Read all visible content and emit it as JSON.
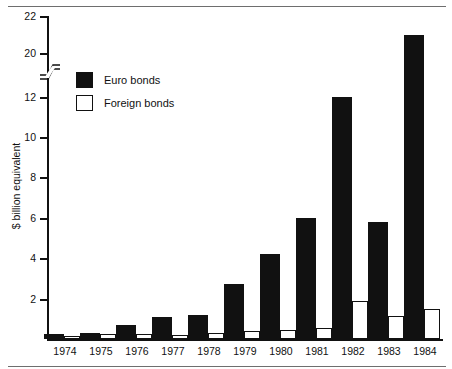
{
  "chart_data": {
    "type": "bar",
    "title": "",
    "subtitle": "",
    "xlabel": "",
    "ylabel": "$ billion equivalent",
    "categories": [
      "1974",
      "1975",
      "1976",
      "1977",
      "1978",
      "1979",
      "1980",
      "1981",
      "1982",
      "1983",
      "1984"
    ],
    "series": [
      {
        "name": "Euro bonds",
        "color": "#111111",
        "style": "filled",
        "values": [
          0.25,
          0.3,
          0.7,
          1.1,
          1.2,
          2.75,
          4.2,
          6.0,
          12.0,
          5.8,
          21.0
        ]
      },
      {
        "name": "Foreign bonds",
        "color": "#ffffff",
        "style": "hollow-outlined",
        "values": [
          0.15,
          0.25,
          0.25,
          0.2,
          0.3,
          0.4,
          0.45,
          0.55,
          1.9,
          1.15,
          1.5
        ]
      }
    ],
    "ylim": [
      0,
      22
    ],
    "y_axis_broken": true,
    "y_axis_break_between": [
      12,
      20
    ],
    "ytick_labels": [
      "2",
      "4",
      "6",
      "8",
      "10",
      "12",
      "20",
      "22"
    ],
    "ytick_values": [
      2,
      4,
      6,
      8,
      10,
      12,
      20,
      22
    ],
    "grid": false,
    "legend_position": "upper-left-inside"
  },
  "axis": {
    "y_title": "$ billion equivalent",
    "ticks": [
      {
        "label": "22",
        "value": 22,
        "y": 16
      },
      {
        "label": "20",
        "value": 20,
        "y": 53
      },
      {
        "label": "12",
        "value": 12,
        "y": 97
      },
      {
        "label": "10",
        "value": 10,
        "y": 137
      },
      {
        "label": "8",
        "value": 8,
        "y": 177
      },
      {
        "label": "6",
        "value": 6,
        "y": 218
      },
      {
        "label": "4",
        "value": 4,
        "y": 258
      },
      {
        "label": "2",
        "value": 2,
        "y": 299
      }
    ]
  },
  "legend": {
    "items": [
      {
        "label": "Euro bonds",
        "swatch": "filled-square"
      },
      {
        "label": "Foreign bonds",
        "swatch": "hollow-square"
      }
    ]
  },
  "colors": {
    "bar_fill": "#111111",
    "bar_outline": "#111111",
    "background": "#ffffff",
    "rule": "#6e6e6e"
  }
}
